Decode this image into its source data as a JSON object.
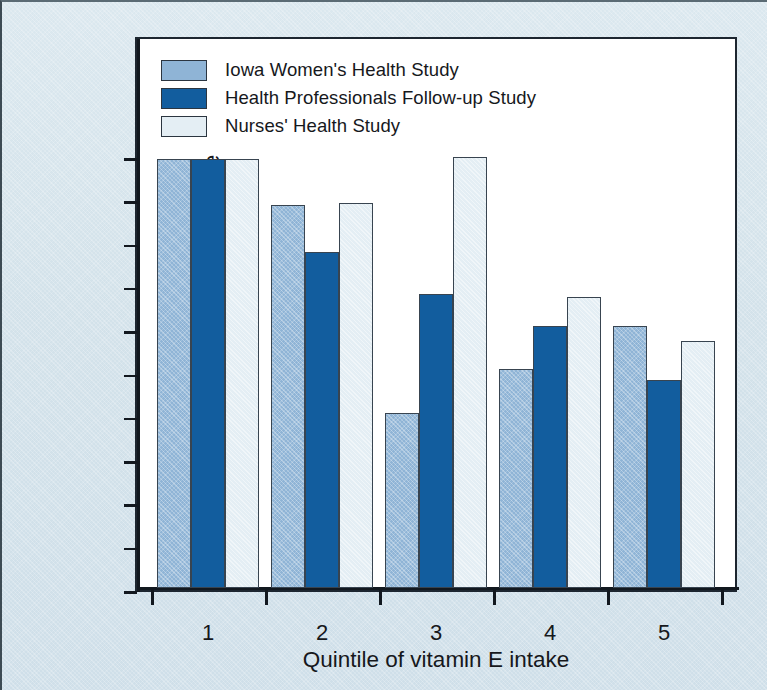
{
  "figure": {
    "background_color": "#d6e4ec",
    "panel_color": "#ffffff",
    "frame_color": "#1d2630"
  },
  "legend": {
    "position": "top-left inside plot",
    "items": [
      {
        "label": "Iowa Women's Health Study",
        "color": "#8fb4d6",
        "swatch_name": "legend-swatch-iowa"
      },
      {
        "label": "Health Professionals Follow-up Study",
        "color": "#125d9e",
        "swatch_name": "legend-swatch-health-professionals"
      },
      {
        "label": "Nurses' Health Study",
        "color": "#e4eef4",
        "swatch_name": "legend-swatch-nurses"
      }
    ]
  },
  "axes": {
    "y_title": "Relative risk of coronary heart disease",
    "x_title": "Quintile of vitamin E intake",
    "y_ticks": [
      "0",
      "0.1",
      "0.2",
      "0.3",
      "0.4",
      "0.5",
      "0.6",
      "0.7",
      "0.8",
      "0.9",
      "1"
    ],
    "x_ticks": [
      "1",
      "2",
      "3",
      "4",
      "5"
    ]
  },
  "chart_data": {
    "type": "bar",
    "title": "",
    "xlabel": "Quintile of vitamin E intake",
    "ylabel": "Relative risk of coronary heart disease",
    "categories": [
      "1",
      "2",
      "3",
      "4",
      "5"
    ],
    "ylim": [
      0,
      1
    ],
    "ytick_values": [
      0,
      0.1,
      0.2,
      0.3,
      0.4,
      0.5,
      0.6,
      0.7,
      0.8,
      0.9,
      1
    ],
    "grid": false,
    "legend_position": "upper left",
    "series": [
      {
        "name": "Iowa Women's Health Study",
        "color": "#8fb4d6",
        "values": [
          0.99,
          0.885,
          0.405,
          0.505,
          0.605
        ]
      },
      {
        "name": "Health Professionals Follow-up Study",
        "color": "#125d9e",
        "values": [
          0.99,
          0.775,
          0.68,
          0.605,
          0.48
        ]
      },
      {
        "name": "Nurses' Health Study",
        "color": "#e4eef4",
        "values": [
          0.99,
          0.89,
          0.995,
          0.672,
          0.57
        ]
      }
    ]
  }
}
